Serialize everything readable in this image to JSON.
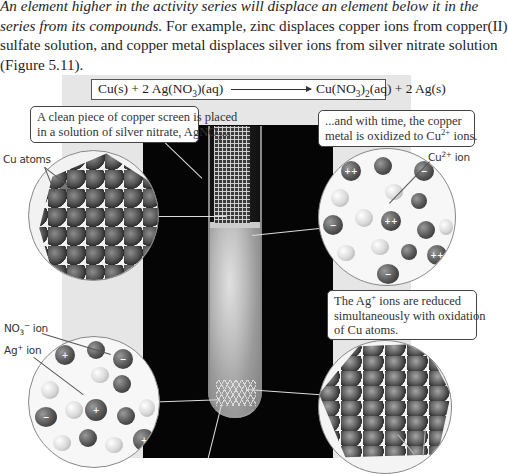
{
  "intro_text": {
    "line1_italic": "An element higher in the activity series will displace an element below it in the",
    "line2_italic": "series from its compounds.",
    "line2_rest": " For example, zinc displaces copper ions from copper(II)",
    "line3": "sulfate solution, and copper metal displaces silver ions from silver nitrate solution",
    "line4": "(Figure 5.11)."
  },
  "figure": {
    "equation": {
      "reactants": "Cu(s) + 2 Ag(NO",
      "reactants_sub": "3",
      "reactants_end": ")(aq)",
      "products": "Cu(NO",
      "products_sub1": "3",
      "products_mid": ")",
      "products_sub2": "2",
      "products_end": "(aq) + 2 Ag(s)"
    },
    "callouts": {
      "copper_screen_line1": "A clean piece of copper screen is placed",
      "copper_screen_line2": "in a solution of silver nitrate, AgNO",
      "copper_screen_sub": "3",
      "copper_screen_end": "...",
      "oxidized_line1": "...and with time, the copper",
      "oxidized_line2": "metal is oxidized to Cu",
      "oxidized_sup": "2+",
      "oxidized_end": " ions.",
      "reduced_line1": "The Ag",
      "reduced_sup": "+",
      "reduced_line1_end": " ions are reduced",
      "reduced_line2": "simultaneously with oxidation",
      "reduced_line3": "of Cu atoms."
    },
    "labels": {
      "cu_atoms": "Cu atoms",
      "cu2_ion": "Cu",
      "cu2_ion_sup": "2+",
      "cu2_ion_end": " ion",
      "no3_ion": "NO",
      "no3_sub": "3",
      "no3_sup": "−",
      "no3_end": " ion",
      "ag_ion": "Ag",
      "ag_ion_sup": "+",
      "ag_ion_end": " ion"
    },
    "ion_signs": {
      "cu2": "++",
      "anion": "−",
      "ag": "+"
    }
  }
}
